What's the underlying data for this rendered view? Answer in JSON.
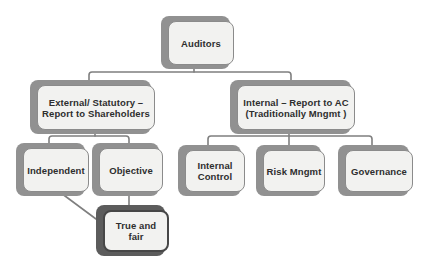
{
  "colors": {
    "background": "#ffffff",
    "card-fill": "#f2f2f0",
    "card-border": "#8b8b8b",
    "card-shadow": "#919191",
    "dark-card-shadow": "#5c5c5c",
    "dark-card-border": "#474747",
    "connector": "#7f7f7f",
    "text": "#2e2e2e"
  },
  "diagram": {
    "type": "org-chart",
    "nodes": [
      {
        "id": "auditors",
        "lines": [
          "Auditors"
        ]
      },
      {
        "id": "external-statutory",
        "lines": [
          "External/ Statutory –",
          "Report to Shareholders"
        ]
      },
      {
        "id": "internal-report-ac",
        "lines": [
          "Internal – Report to AC",
          "(Traditionally Mngmt )"
        ]
      },
      {
        "id": "independent",
        "lines": [
          "Independent"
        ]
      },
      {
        "id": "objective",
        "lines": [
          "Objective"
        ]
      },
      {
        "id": "internal-control",
        "lines": [
          "Internal",
          "Control"
        ]
      },
      {
        "id": "risk-mngmt",
        "lines": [
          "Risk Mngmt"
        ]
      },
      {
        "id": "governance",
        "lines": [
          "Governance"
        ]
      },
      {
        "id": "true-and-fair",
        "lines": [
          "True and",
          "fair"
        ]
      }
    ],
    "edges": [
      {
        "from": "auditors",
        "to": "external-statutory"
      },
      {
        "from": "auditors",
        "to": "internal-report-ac"
      },
      {
        "from": "external-statutory",
        "to": "independent"
      },
      {
        "from": "external-statutory",
        "to": "objective"
      },
      {
        "from": "internal-report-ac",
        "to": "internal-control"
      },
      {
        "from": "internal-report-ac",
        "to": "risk-mngmt"
      },
      {
        "from": "internal-report-ac",
        "to": "governance"
      },
      {
        "from": "objective",
        "to": "true-and-fair"
      },
      {
        "from": "independent",
        "to": "true-and-fair"
      }
    ]
  }
}
